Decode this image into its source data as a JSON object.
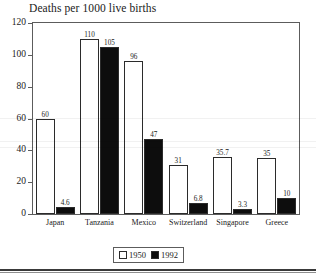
{
  "chart_data": {
    "type": "bar",
    "title": "Deaths per 1000 live births",
    "xlabel": "",
    "ylabel": "",
    "ylim": [
      0,
      120
    ],
    "yticks": [
      0,
      20,
      40,
      60,
      80,
      100,
      120
    ],
    "grid": false,
    "legend_position": "bottom-center",
    "categories": [
      "Japan",
      "Tanzania",
      "Mexico",
      "Switzerland",
      "Singapore",
      "Greece"
    ],
    "series": [
      {
        "name": "1950",
        "color": "#ffffff",
        "values": [
          60,
          110,
          96,
          31,
          35.7,
          35
        ],
        "labels": [
          "60",
          "110",
          "96",
          "31",
          "35.7",
          "35"
        ]
      },
      {
        "name": "1992",
        "color": "#0d0d0d",
        "values": [
          4.6,
          105,
          47,
          6.8,
          3.3,
          10
        ],
        "labels": [
          "4.6",
          "105",
          "47",
          "6.8",
          "3.3",
          "10"
        ]
      }
    ]
  },
  "axis": {
    "y_tick_labels": [
      "120",
      "100",
      "80",
      "60",
      "40",
      "20",
      "0"
    ]
  },
  "legend": {
    "entries": [
      {
        "label": "1950",
        "swatch": "white"
      },
      {
        "label": "1992",
        "swatch": "black"
      }
    ]
  }
}
